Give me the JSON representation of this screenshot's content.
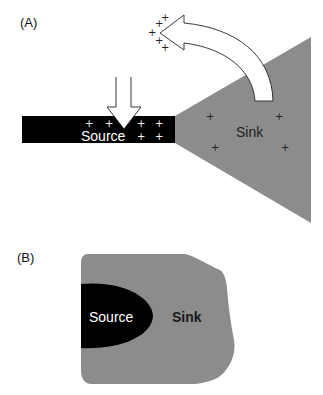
{
  "colors": {
    "background": "#ffffff",
    "source": "#000000",
    "sink": "#8c8c8c",
    "arrow_fill": "#ffffff",
    "arrow_stroke": "#222222"
  },
  "panel_a": {
    "label": "(A)",
    "source_label": "Source",
    "sink_label": "Sink",
    "source_charges": [
      "+",
      "+",
      "+",
      "+",
      "+",
      "+"
    ],
    "sink_charges": [
      "+",
      "+",
      "+",
      "+"
    ],
    "escaping_charges": [
      "+",
      "+",
      "+",
      "+",
      "+"
    ],
    "arrows": [
      {
        "name": "inflow-arrow",
        "direction": "down",
        "target": "Source"
      },
      {
        "name": "outflow-arrow",
        "direction": "curved-up-left",
        "origin": "Sink"
      }
    ]
  },
  "panel_b": {
    "label": "(B)",
    "source_label": "Source",
    "sink_label": "Sink"
  }
}
